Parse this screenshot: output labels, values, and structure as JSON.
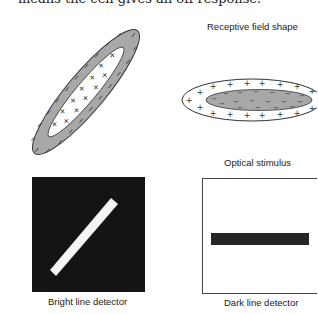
{
  "caption_fragment": "means the cell gives an off response.",
  "labels": {
    "receptive_field_shape": "Receptive field shape",
    "optical_stimulus": "Optical stimulus",
    "bright_line_detector": "Bright line detector",
    "dark_line_detector": "Dark line detector"
  },
  "colors": {
    "surround_gray": "#a8a8a8",
    "outline": "#333333",
    "black_field": "#141414",
    "bright_bar": "#f4f4f4",
    "dark_bar": "#262626"
  },
  "symbols": {
    "plus": "+",
    "minus": "−"
  }
}
